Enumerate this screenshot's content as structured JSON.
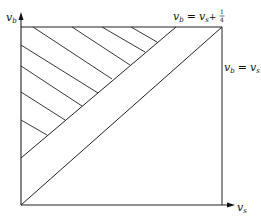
{
  "diagram": {
    "y_axis": {
      "symbol": "v",
      "subscript": "b"
    },
    "x_axis": {
      "symbol": "v",
      "subscript": "s"
    },
    "line_upper": {
      "label_lhs_symbol": "v",
      "label_lhs_sub": "b",
      "label_eq": "=",
      "label_rhs_symbol": "v",
      "label_rhs_sub": "s",
      "label_plus": "+",
      "label_frac_num": "1",
      "label_frac_den": "4"
    },
    "line_diagonal": {
      "label_lhs_symbol": "v",
      "label_lhs_sub": "b",
      "label_eq": "=",
      "label_rhs_symbol": "v",
      "label_rhs_sub": "s"
    },
    "colors": {
      "stroke": "#222222",
      "background": "#ffffff"
    }
  }
}
